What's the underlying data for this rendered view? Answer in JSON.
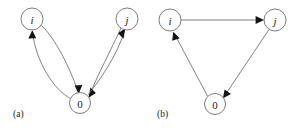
{
  "figure": {
    "width": 296,
    "height": 128,
    "background": "#ffffff",
    "node_stroke": "#6e6e6e",
    "edge_stroke": "#6b6b6b",
    "arrow_fill": "#131313",
    "label_color": "#1a1a1a"
  },
  "panels": [
    {
      "id": "panel-a",
      "caption": "(a)",
      "caption_x": 13,
      "caption_y": 117,
      "description": "Two-way curved edges between i and 0, and between j and 0",
      "nodes": [
        {
          "id": "a-i",
          "label": "i",
          "italic": true,
          "cx": 32,
          "cy": 19,
          "r": 11
        },
        {
          "id": "a-j",
          "label": "j",
          "italic": true,
          "cx": 127,
          "cy": 19,
          "r": 11
        },
        {
          "id": "a-0",
          "label": "0",
          "italic": false,
          "cx": 80,
          "cy": 103,
          "r": 10.5
        }
      ],
      "edges": [
        {
          "id": "a-i-to-0",
          "from": "i",
          "to": "0",
          "style": "curved",
          "direction": "forward"
        },
        {
          "id": "a-0-to-i",
          "from": "0",
          "to": "i",
          "style": "curved",
          "direction": "forward"
        },
        {
          "id": "a-j-to-0",
          "from": "j",
          "to": "0",
          "style": "curved",
          "direction": "forward"
        },
        {
          "id": "a-0-to-j",
          "from": "0",
          "to": "j",
          "style": "curved",
          "direction": "forward"
        }
      ]
    },
    {
      "id": "panel-b",
      "caption": "(b)",
      "caption_x": 157,
      "caption_y": 117,
      "description": "Directed cycle i to j to 0 to i with straight edges",
      "nodes": [
        {
          "id": "b-i",
          "label": "i",
          "italic": true,
          "cx": 170,
          "cy": 20,
          "r": 11
        },
        {
          "id": "b-j",
          "label": "j",
          "italic": true,
          "cx": 275,
          "cy": 20,
          "r": 11
        },
        {
          "id": "b-0",
          "label": "0",
          "italic": false,
          "cx": 215,
          "cy": 104,
          "r": 10.5
        }
      ],
      "edges": [
        {
          "id": "b-i-to-j",
          "from": "i",
          "to": "j",
          "style": "straight",
          "direction": "forward"
        },
        {
          "id": "b-j-to-0",
          "from": "j",
          "to": "0",
          "style": "straight",
          "direction": "forward"
        },
        {
          "id": "b-0-to-i",
          "from": "0",
          "to": "i",
          "style": "straight",
          "direction": "forward"
        }
      ]
    }
  ]
}
